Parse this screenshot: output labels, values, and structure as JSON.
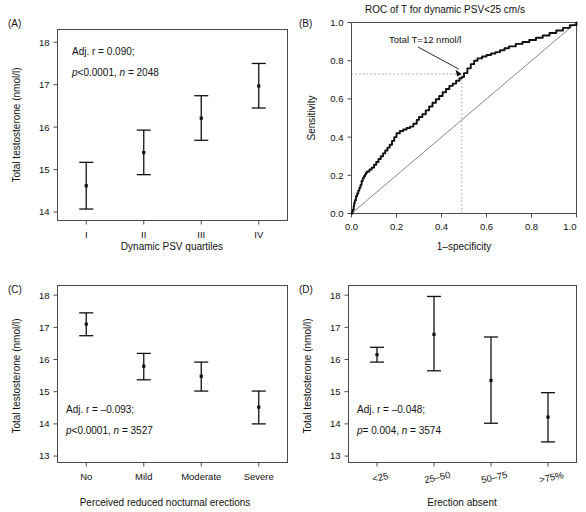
{
  "figure": {
    "panels": [
      "A",
      "B",
      "C",
      "D"
    ]
  },
  "panelA": {
    "tag": "(A)",
    "ylabel": "Total testosterone (nmol/l)",
    "xlabel": "Dynamic PSV quartiles",
    "stat_line1": "Adj. r = 0.090;",
    "stat_line2_p": "p",
    "stat_line2_rest": "<0.0001, ",
    "stat_line2_n": "n",
    "stat_line2_nval": " = 2048",
    "yticks": [
      "14",
      "15",
      "16",
      "17",
      "18"
    ],
    "xticks": [
      "I",
      "II",
      "III",
      "IV"
    ]
  },
  "panelB": {
    "tag": "(B)",
    "title": "ROC of T for dynamic PSV<25 cm/s",
    "ylabel": "Sensitivity",
    "xlabel": "1–specificity",
    "annotation": "Total T=12 nmol/l",
    "yticks": [
      "0.0",
      "0.2",
      "0.4",
      "0.6",
      "0.8",
      "1.0"
    ],
    "xticks": [
      "0.0",
      "0.2",
      "0.4",
      "0.6",
      "0.8",
      "1.0"
    ]
  },
  "panelC": {
    "tag": "(C)",
    "ylabel": "Total testosterone (nmol/l)",
    "xlabel": "Perceived reduced nocturnal erections",
    "stat_line1": "Adj. r = –0.093;",
    "stat_line2_p": "p",
    "stat_line2_rest": "<0.0001, ",
    "stat_line2_n": "n",
    "stat_line2_nval": " = 3527",
    "yticks": [
      "13",
      "14",
      "15",
      "16",
      "17",
      "18"
    ],
    "xticks": [
      "No",
      "Mild",
      "Moderate",
      "Severe"
    ]
  },
  "panelD": {
    "tag": "(D)",
    "ylabel": "Total testosterone (nmol/l)",
    "xlabel": "Erection absent",
    "stat_line1": "Adj. r = –0.048;",
    "stat_line2_p": "p",
    "stat_line2_rest": "= 0.004, ",
    "stat_line2_n": "n",
    "stat_line2_nval": " = 3574",
    "yticks": [
      "13",
      "14",
      "15",
      "16",
      "17",
      "18"
    ],
    "xticks": [
      "<25",
      "25–50",
      "50–75",
      ">75%"
    ]
  },
  "chart_data": [
    {
      "type": "scatter",
      "panel": "A",
      "title": "",
      "xlabel": "Dynamic PSV quartiles",
      "ylabel": "Total testosterone (nmol/l)",
      "categories": [
        "I",
        "II",
        "III",
        "IV"
      ],
      "values": [
        14.62,
        15.4,
        16.21,
        16.97
      ],
      "err_low": [
        14.07,
        14.88,
        15.69,
        16.45
      ],
      "err_high": [
        15.17,
        15.93,
        16.74,
        17.5
      ],
      "ylim": [
        13.8,
        18.3
      ],
      "grid": false,
      "legend": "none",
      "annotations": [
        "Adj. r = 0.090;",
        "p<0.0001, n = 2048"
      ]
    },
    {
      "type": "line",
      "panel": "B",
      "title": "ROC of T for dynamic PSV<25 cm/s",
      "xlabel": "1–specificity",
      "ylabel": "Sensitivity",
      "xlim": [
        0.0,
        1.0
      ],
      "ylim": [
        0.0,
        1.0
      ],
      "grid": false,
      "legend": "none",
      "operating_point": {
        "x": 0.49,
        "y": 0.73,
        "label": "Total T=12 nmol/l"
      },
      "series": [
        {
          "name": "ROC curve",
          "x": [
            0.0,
            0.005,
            0.01,
            0.012,
            0.015,
            0.02,
            0.025,
            0.03,
            0.035,
            0.04,
            0.045,
            0.05,
            0.055,
            0.06,
            0.065,
            0.07,
            0.08,
            0.09,
            0.1,
            0.11,
            0.12,
            0.13,
            0.14,
            0.15,
            0.16,
            0.17,
            0.18,
            0.19,
            0.2,
            0.215,
            0.23,
            0.245,
            0.26,
            0.275,
            0.29,
            0.3,
            0.315,
            0.33,
            0.345,
            0.36,
            0.375,
            0.39,
            0.405,
            0.42,
            0.435,
            0.45,
            0.465,
            0.48,
            0.49,
            0.5,
            0.515,
            0.53,
            0.545,
            0.56,
            0.58,
            0.6,
            0.62,
            0.64,
            0.66,
            0.68,
            0.7,
            0.73,
            0.76,
            0.79,
            0.82,
            0.85,
            0.88,
            0.91,
            0.94,
            0.97,
            1.0
          ],
          "y": [
            0.0,
            0.02,
            0.04,
            0.055,
            0.07,
            0.09,
            0.105,
            0.12,
            0.135,
            0.15,
            0.17,
            0.185,
            0.195,
            0.205,
            0.215,
            0.22,
            0.23,
            0.24,
            0.255,
            0.27,
            0.285,
            0.3,
            0.315,
            0.33,
            0.345,
            0.36,
            0.38,
            0.4,
            0.42,
            0.432,
            0.44,
            0.448,
            0.455,
            0.47,
            0.49,
            0.505,
            0.52,
            0.54,
            0.56,
            0.58,
            0.598,
            0.615,
            0.635,
            0.652,
            0.668,
            0.68,
            0.695,
            0.708,
            0.715,
            0.735,
            0.76,
            0.782,
            0.8,
            0.812,
            0.822,
            0.83,
            0.838,
            0.845,
            0.855,
            0.865,
            0.875,
            0.888,
            0.898,
            0.908,
            0.92,
            0.932,
            0.945,
            0.958,
            0.972,
            0.986,
            1.0
          ]
        },
        {
          "name": "reference diagonal",
          "x": [
            0.0,
            1.0
          ],
          "y": [
            0.0,
            1.0
          ]
        }
      ]
    },
    {
      "type": "scatter",
      "panel": "C",
      "title": "",
      "xlabel": "Perceived reduced nocturnal erections",
      "ylabel": "Total testosterone (nmol/l)",
      "categories": [
        "No",
        "Mild",
        "Moderate",
        "Severe"
      ],
      "values": [
        17.1,
        15.79,
        15.48,
        14.52
      ],
      "err_low": [
        16.74,
        15.37,
        15.02,
        14.0
      ],
      "err_high": [
        17.45,
        16.19,
        15.92,
        15.02
      ],
      "ylim": [
        12.8,
        18.3
      ],
      "grid": false,
      "legend": "none",
      "annotations": [
        "Adj. r = –0.093;",
        "p<0.0001, n = 3527"
      ]
    },
    {
      "type": "scatter",
      "panel": "D",
      "title": "",
      "xlabel": "Erection absent",
      "ylabel": "Total testosterone (nmol/l)",
      "categories": [
        "<25",
        "25–50",
        "50–75",
        ">75%"
      ],
      "values": [
        16.15,
        16.78,
        15.35,
        14.21
      ],
      "err_low": [
        15.92,
        15.65,
        14.02,
        13.44
      ],
      "err_high": [
        16.38,
        17.96,
        16.7,
        14.97
      ],
      "ylim": [
        12.8,
        18.3
      ],
      "grid": false,
      "legend": "none",
      "annotations": [
        "Adj. r = –0.048;",
        "p = 0.004, n = 3574"
      ]
    }
  ]
}
